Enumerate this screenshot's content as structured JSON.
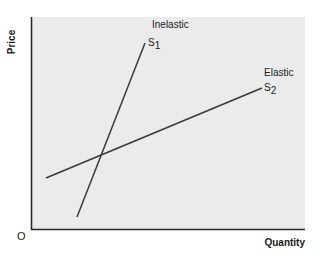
{
  "chart_data": {
    "type": "line",
    "title": "",
    "xlabel": "Quantity",
    "ylabel": "Price",
    "origin_label": "O",
    "grid": false,
    "ticks": "none",
    "series": [
      {
        "name": "S1",
        "label": "Inelastic",
        "symbol": "S",
        "subscript": "1",
        "description": "steep supply curve",
        "points_px": [
          [
            77,
            217
          ],
          [
            145,
            43
          ]
        ]
      },
      {
        "name": "S2",
        "label": "Elastic",
        "symbol": "S",
        "subscript": "2",
        "description": "flat supply curve",
        "points_px": [
          [
            46,
            178
          ],
          [
            262,
            88
          ]
        ]
      }
    ],
    "intersection_px": [
      100,
      153
    ]
  },
  "colors": {
    "plot_bg": "#ebebeb",
    "axis": "#2a2a2a",
    "line": "#3a3a3a"
  }
}
